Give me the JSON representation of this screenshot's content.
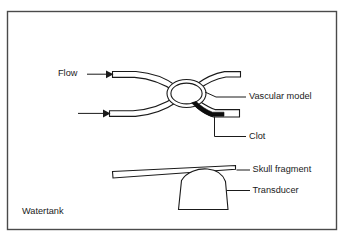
{
  "figure": {
    "background_color": "#ffffff",
    "line_color": "#1a1a1a",
    "border_color": "#4a4a4a",
    "clot_color": "#0d0d0d"
  },
  "labels": {
    "flow": "Flow",
    "vascular_model": "Vascular model",
    "clot": "Clot",
    "skull_fragment": "Skull fragment",
    "transducer": "Transducer",
    "watertank": "Watertank"
  },
  "icons": {
    "flow_arrow_upper": "arrow-right-icon",
    "flow_arrow_lower": "arrow-right-icon"
  }
}
